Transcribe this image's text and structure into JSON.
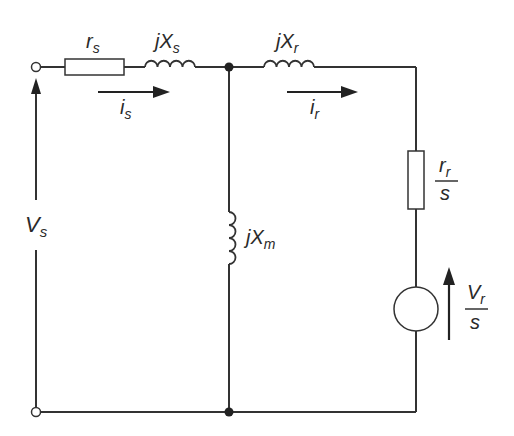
{
  "diagram": {
    "colors": {
      "wire": "#333333",
      "text": "#2a2a2a",
      "background": "#ffffff"
    },
    "components": [
      {
        "id": "rs",
        "type": "resistor",
        "label_main": "r",
        "label_sub": "s"
      },
      {
        "id": "Xs",
        "type": "inductor",
        "label_main": "jX",
        "label_sub": "s"
      },
      {
        "id": "Xr",
        "type": "inductor",
        "label_main": "jX",
        "label_sub": "r"
      },
      {
        "id": "Xm",
        "type": "inductor",
        "label_main": "jX",
        "label_sub": "m"
      },
      {
        "id": "rr_s",
        "type": "resistor",
        "label_num_main": "r",
        "label_num_sub": "r",
        "label_den": "s"
      },
      {
        "id": "Vr_s",
        "type": "voltage-source",
        "label_num_main": "V",
        "label_num_sub": "r",
        "label_den": "s"
      }
    ],
    "currents": [
      {
        "id": "is",
        "label_main": "i",
        "label_sub": "s"
      },
      {
        "id": "ir",
        "label_main": "i",
        "label_sub": "r"
      }
    ],
    "voltages": [
      {
        "id": "Vs",
        "label_main": "V",
        "label_sub": "s"
      }
    ]
  }
}
